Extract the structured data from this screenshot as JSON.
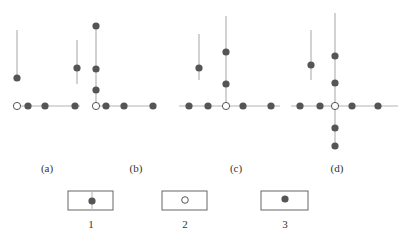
{
  "colors": {
    "line": "#b4b4b4",
    "dot": "#555555",
    "open_stroke": "#555555",
    "box_stroke": "#666666"
  },
  "panels": [
    {
      "label": "(a)",
      "label_x": 47,
      "label_y": 162,
      "lines": [
        [
          17,
          106,
          80,
          106
        ],
        [
          17,
          30,
          17,
          78
        ],
        [
          77,
          40,
          77,
          84
        ]
      ],
      "dots": [
        [
          17,
          78
        ],
        [
          28,
          106
        ],
        [
          45,
          106
        ],
        [
          75,
          106
        ],
        [
          77,
          68
        ]
      ],
      "open": [
        [
          17,
          106
        ]
      ]
    },
    {
      "label": "(b)",
      "label_x": 136,
      "label_y": 162,
      "lines": [
        [
          96,
          106,
          155,
          106
        ],
        [
          96,
          26,
          96,
          106
        ]
      ],
      "dots": [
        [
          96,
          26
        ],
        [
          96,
          69
        ],
        [
          96,
          90
        ],
        [
          106,
          106
        ],
        [
          124,
          106
        ],
        [
          153,
          106
        ]
      ],
      "open": [
        [
          96,
          106
        ]
      ]
    },
    {
      "label": "(c)",
      "label_x": 236,
      "label_y": 162,
      "lines": [
        [
          179,
          106,
          280,
          106
        ],
        [
          226,
          16,
          226,
          106
        ],
        [
          199,
          34,
          199,
          80
        ]
      ],
      "dots": [
        [
          189,
          106
        ],
        [
          208,
          106
        ],
        [
          243,
          106
        ],
        [
          271,
          106
        ],
        [
          226,
          52
        ],
        [
          226,
          84
        ],
        [
          199,
          68
        ]
      ],
      "open": [
        [
          226,
          106
        ]
      ]
    },
    {
      "label": "(d)",
      "label_x": 337,
      "label_y": 162,
      "lines": [
        [
          291,
          106,
          398,
          106
        ],
        [
          335,
          13,
          335,
          147
        ],
        [
          311,
          30,
          311,
          80
        ]
      ],
      "dots": [
        [
          300,
          106
        ],
        [
          320,
          106
        ],
        [
          352,
          106
        ],
        [
          378,
          106
        ],
        [
          335,
          56
        ],
        [
          335,
          83
        ],
        [
          335,
          128
        ],
        [
          335,
          146
        ],
        [
          311,
          65
        ]
      ],
      "open": [
        [
          335,
          106
        ]
      ]
    }
  ],
  "legend": [
    {
      "label": "1",
      "box": [
        68,
        191,
        45,
        19
      ],
      "symbol": "filled-with-line",
      "cx": 92,
      "cy": 201,
      "label_x": 91,
      "label_y": 218
    },
    {
      "label": "2",
      "box": [
        162,
        191,
        45,
        19
      ],
      "symbol": "open",
      "cx": 185,
      "cy": 200,
      "label_x": 185,
      "label_y": 218
    },
    {
      "label": "3",
      "box": [
        261,
        191,
        47,
        19
      ],
      "symbol": "filled",
      "cx": 285,
      "cy": 199,
      "label_x": 285,
      "label_y": 218
    }
  ]
}
